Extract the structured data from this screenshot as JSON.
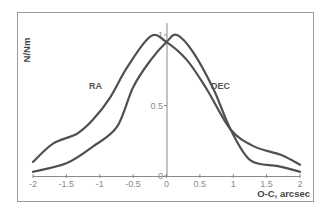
{
  "chart_data": {
    "type": "line",
    "title": "",
    "xlabel": "O-C, arcsec",
    "ylabel": "N/Nm",
    "xlim": [
      -2,
      2
    ],
    "ylim": [
      0,
      1
    ],
    "x_ticks": [
      "-2",
      "-1.5",
      "-1",
      "-0.5",
      "0",
      "0.5",
      "1",
      "1.5",
      "2"
    ],
    "y_ticks": [
      "0",
      "0.5",
      "1"
    ],
    "grid": false,
    "legend": "inline labels",
    "series": [
      {
        "name": "RA",
        "x": [
          -2.0,
          -1.7,
          -1.34,
          -1.1,
          -0.84,
          -0.59,
          -0.24,
          0.0,
          0.31,
          0.61,
          0.96,
          1.31,
          1.71,
          2.0
        ],
        "values": [
          0.1,
          0.23,
          0.3,
          0.4,
          0.56,
          0.77,
          0.99,
          0.95,
          0.82,
          0.61,
          0.33,
          0.21,
          0.15,
          0.08
        ]
      },
      {
        "name": "DEC",
        "x": [
          -2.0,
          -1.5,
          -1.1,
          -0.74,
          -0.5,
          -0.24,
          0.0,
          0.16,
          0.41,
          0.71,
          0.96,
          1.26,
          1.67,
          2.0
        ],
        "values": [
          0.03,
          0.09,
          0.21,
          0.35,
          0.63,
          0.82,
          0.95,
          1.0,
          0.87,
          0.61,
          0.33,
          0.11,
          0.07,
          0.03
        ]
      }
    ]
  }
}
